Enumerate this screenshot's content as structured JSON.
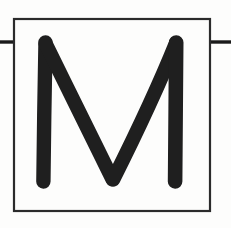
{
  "canvas": {
    "width": 231,
    "height": 228,
    "background_color": "#fdfdfc"
  },
  "card": {
    "label": "letter card",
    "glyph_character": "M",
    "glyph_description": "uppercase letter M drawn in a thick rounded-cap stroke",
    "glyph_color": "#1f1f1f",
    "glyph_stroke_width": 14,
    "border_label": "square frame",
    "border_color": "#2a2a2a",
    "border_width": 2,
    "frame": {
      "x": 13,
      "y": 18,
      "width": 198,
      "height": 194
    }
  },
  "rules": {
    "color": "#1a1a1a",
    "thickness": 3,
    "y": 42,
    "left": {
      "label": "left baseline rule",
      "x1": 0,
      "x2": 14
    },
    "right": {
      "label": "right baseline rule",
      "x1": 210,
      "x2": 231
    }
  },
  "glyph_path": {
    "outline": "M 45 42 L 43 182",
    "points": [
      {
        "name": "left-stem-top",
        "x": 45,
        "y": 42
      },
      {
        "name": "left-stem-bottom",
        "x": 43,
        "y": 182
      },
      {
        "name": "middle-vertex",
        "x": 113,
        "y": 180
      },
      {
        "name": "right-stem-top",
        "x": 176,
        "y": 42
      },
      {
        "name": "right-stem-bottom",
        "x": 175,
        "y": 182
      }
    ]
  }
}
